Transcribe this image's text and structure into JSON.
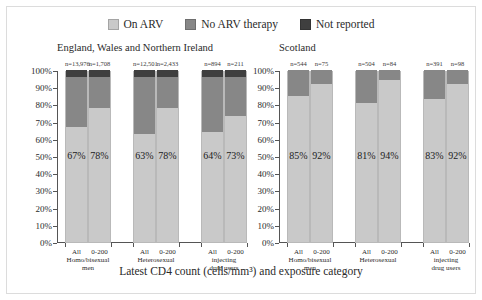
{
  "legend": {
    "items": [
      {
        "label": "On ARV",
        "color": "#c9c9c9",
        "key": "on_arv"
      },
      {
        "label": "No ARV therapy",
        "color": "#878787",
        "key": "no_arv"
      },
      {
        "label": "Not reported",
        "color": "#3f3f3f",
        "key": "not_reported"
      }
    ]
  },
  "axis_title": "Latest CD4 count (cells/mm³) and exposure category",
  "panels": [
    {
      "id": "ew",
      "title": "England, Wales and Northern Ireland"
    },
    {
      "id": "sc",
      "title": "Scotland"
    }
  ],
  "y_axis": {
    "ticks": [
      "0%",
      "10%",
      "20%",
      "30%",
      "40%",
      "50%",
      "60%",
      "70%",
      "80%",
      "90%",
      "100%"
    ],
    "min": 0,
    "max": 100
  },
  "chart_data": {
    "type": "bar",
    "title": "",
    "subtype": "stacked-percentage",
    "xlabel": "Latest CD4 count (cells/mm³) and exposure category",
    "ylabel": "",
    "ylim": [
      0,
      100
    ],
    "grid": false,
    "legend_position": "top-center",
    "legend_entries": [
      "On ARV",
      "No ARV therapy",
      "Not reported"
    ],
    "panels": [
      {
        "name": "England, Wales and Northern Ireland",
        "groups": [
          {
            "exposure": "Homo/bisexual men",
            "bars": [
              {
                "category": "All",
                "n_label": "n=13,976",
                "n": 13976,
                "on_arv": 67,
                "no_arv": 29,
                "not_reported": 4,
                "label": "67%"
              },
              {
                "category": "0-200",
                "n_label": "n=1,708",
                "n": 1708,
                "on_arv": 78,
                "no_arv": 18,
                "not_reported": 4,
                "label": "78%"
              }
            ]
          },
          {
            "exposure": "Heterosexual",
            "bars": [
              {
                "category": "All",
                "n_label": "n=12,501",
                "n": 12501,
                "on_arv": 63,
                "no_arv": 33,
                "not_reported": 4,
                "label": "63%"
              },
              {
                "category": "0-200",
                "n_label": "n=2,433",
                "n": 2433,
                "on_arv": 78,
                "no_arv": 18,
                "not_reported": 4,
                "label": "78%"
              }
            ]
          },
          {
            "exposure": "injecting drug users",
            "bars": [
              {
                "category": "All",
                "n_label": "n=894",
                "n": 894,
                "on_arv": 64,
                "no_arv": 32,
                "not_reported": 4,
                "label": "64%"
              },
              {
                "category": "0-200",
                "n_label": "n=211",
                "n": 211,
                "on_arv": 73,
                "no_arv": 23,
                "not_reported": 4,
                "label": "73%"
              }
            ]
          }
        ]
      },
      {
        "name": "Scotland",
        "groups": [
          {
            "exposure": "Homo/bisexual men",
            "bars": [
              {
                "category": "All",
                "n_label": "n=544",
                "n": 544,
                "on_arv": 85,
                "no_arv": 15,
                "not_reported": 0,
                "label": "85%"
              },
              {
                "category": "0-200",
                "n_label": "n=75",
                "n": 75,
                "on_arv": 92,
                "no_arv": 8,
                "not_reported": 0,
                "label": "92%"
              }
            ]
          },
          {
            "exposure": "Heterosexual",
            "bars": [
              {
                "category": "All",
                "n_label": "n=504",
                "n": 504,
                "on_arv": 81,
                "no_arv": 19,
                "not_reported": 0,
                "label": "81%"
              },
              {
                "category": "0-200",
                "n_label": "n=84",
                "n": 84,
                "on_arv": 94,
                "no_arv": 6,
                "not_reported": 0,
                "label": "94%"
              }
            ]
          },
          {
            "exposure": "injecting drug users",
            "bars": [
              {
                "category": "All",
                "n_label": "n=391",
                "n": 391,
                "on_arv": 83,
                "no_arv": 17,
                "not_reported": 0,
                "label": "83%"
              },
              {
                "category": "0-200",
                "n_label": "n=98",
                "n": 98,
                "on_arv": 92,
                "no_arv": 8,
                "not_reported": 0,
                "label": "92%"
              }
            ]
          }
        ]
      }
    ]
  },
  "exposure_label_lines": {
    "Homo/bisexual men": [
      "Homo/bisexual",
      "men"
    ],
    "Heterosexual": [
      "Heterosexual"
    ],
    "injecting drug users": [
      "injecting",
      "drug users"
    ]
  }
}
